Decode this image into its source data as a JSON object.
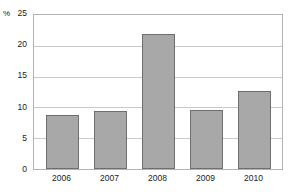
{
  "chart_data": {
    "type": "bar",
    "title": "",
    "subtitle": "",
    "xlabel": "",
    "ylabel": "%",
    "unit_label": "%",
    "categories": [
      "2006",
      "2007",
      "2008",
      "2009",
      "2010"
    ],
    "values": [
      8.8,
      9.4,
      22.0,
      9.6,
      12.7
    ],
    "series": [
      {
        "name": "",
        "values": [
          8.8,
          9.4,
          22.0,
          9.6,
          12.7
        ]
      }
    ],
    "ylim": [
      0,
      25
    ],
    "yticks": [
      0,
      5,
      10,
      15,
      20,
      25
    ],
    "ytick_labels": [
      "0",
      "5",
      "10",
      "15",
      "20",
      "25"
    ],
    "xtick_labels": [
      "2006",
      "2007",
      "2008",
      "2009",
      "2010"
    ],
    "grid": true,
    "grid_axis": "y",
    "legend": false,
    "legend_position": "none",
    "annotations": [],
    "colors": {
      "bar_fill": "#a8a8a8",
      "bar_border": "#6e6e6e",
      "gridline": "#c9c9c9",
      "axis_border": "#b3b3b3",
      "plot_background": "#ffffff",
      "page_background": "#ffffff",
      "text": "#1a1a1a"
    }
  }
}
